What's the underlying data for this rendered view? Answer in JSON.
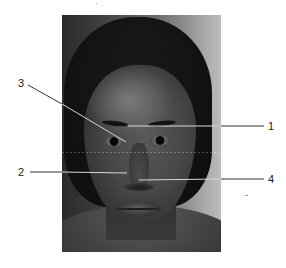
{
  "figure": {
    "type": "annotated-photograph",
    "photo_bounds": {
      "left": 62,
      "top": 15,
      "right": 221,
      "bottom": 252
    },
    "colors": {
      "leader_line": "#d8d8d8",
      "leader_line_outer": "#333333",
      "label": "#222222",
      "background": "#ffffff"
    }
  },
  "labels": [
    {
      "id": "1",
      "text": "1",
      "side": "right",
      "x": 268,
      "y": 126,
      "line": {
        "x1": 128,
        "y1": 126,
        "x2": 264,
        "y2": 126
      }
    },
    {
      "id": "2",
      "text": "2",
      "side": "left",
      "x": 18,
      "y": 172,
      "line": {
        "x1": 30,
        "y1": 172,
        "x2": 127,
        "y2": 173
      }
    },
    {
      "id": "3",
      "text": "3",
      "side": "left",
      "x": 18,
      "y": 83,
      "line": {
        "x1": 28,
        "y1": 85,
        "x2": 126,
        "y2": 142
      }
    },
    {
      "id": "4",
      "text": "4",
      "side": "right",
      "x": 268,
      "y": 179,
      "line": {
        "x1": 139,
        "y1": 180,
        "x2": 264,
        "y2": 179
      }
    }
  ]
}
